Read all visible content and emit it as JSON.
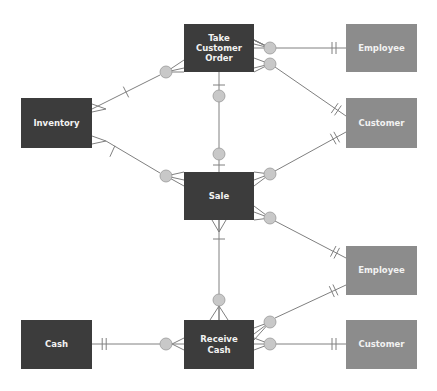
{
  "diagram": {
    "type": "REA entity-relationship diagram",
    "colors": {
      "event_box": "#3c3c3c",
      "agent_box": "#8c8c8c",
      "line": "#808080",
      "optional_circle": "#c8c8c8",
      "text": "#f2f2f2"
    },
    "entities": [
      {
        "id": "take_order",
        "label": "Take\nCustomer Order",
        "style": "dark",
        "x": 184,
        "y": 24,
        "w": 70,
        "h": 48
      },
      {
        "id": "employee_top",
        "label": "Employee",
        "style": "light",
        "x": 346,
        "y": 24,
        "w": 71,
        "h": 48
      },
      {
        "id": "inventory",
        "label": "Inventory",
        "style": "dark",
        "x": 21,
        "y": 98,
        "w": 71,
        "h": 50
      },
      {
        "id": "customer_top",
        "label": "Customer",
        "style": "light",
        "x": 346,
        "y": 98,
        "w": 71,
        "h": 50
      },
      {
        "id": "sale",
        "label": "Sale",
        "style": "dark",
        "x": 184,
        "y": 172,
        "w": 70,
        "h": 48
      },
      {
        "id": "employee_mid",
        "label": "Employee",
        "style": "light",
        "x": 346,
        "y": 246,
        "w": 71,
        "h": 49
      },
      {
        "id": "cash",
        "label": "Cash",
        "style": "dark",
        "x": 21,
        "y": 320,
        "w": 71,
        "h": 49
      },
      {
        "id": "receive_cash",
        "label": "Receive\nCash",
        "style": "dark",
        "x": 184,
        "y": 320,
        "w": 70,
        "h": 49
      },
      {
        "id": "customer_bottom",
        "label": "Customer",
        "style": "light",
        "x": 346,
        "y": 320,
        "w": 71,
        "h": 49
      }
    ],
    "relationships": [
      {
        "from": "take_order",
        "to": "employee_top",
        "from_end": "zero-or-many",
        "to_end": "one-and-only-one"
      },
      {
        "from": "take_order",
        "to": "customer_top",
        "from_end": "zero-or-many",
        "to_end": "one-and-only-one"
      },
      {
        "from": "take_order",
        "to": "inventory",
        "from_end": "zero-or-many",
        "to_end": "one-or-many"
      },
      {
        "from": "take_order",
        "to": "sale",
        "from_end": "zero-or-one",
        "to_end": "zero-or-one"
      },
      {
        "from": "sale",
        "to": "inventory",
        "from_end": "zero-or-many",
        "to_end": "one-or-many"
      },
      {
        "from": "sale",
        "to": "customer_top",
        "from_end": "zero-or-many",
        "to_end": "one-and-only-one"
      },
      {
        "from": "sale",
        "to": "employee_mid",
        "from_end": "zero-or-many",
        "to_end": "one-and-only-one"
      },
      {
        "from": "sale",
        "to": "receive_cash",
        "from_end": "one-or-many",
        "to_end": "zero-or-many"
      },
      {
        "from": "receive_cash",
        "to": "employee_mid",
        "from_end": "zero-or-many",
        "to_end": "one-and-only-one"
      },
      {
        "from": "receive_cash",
        "to": "customer_bottom",
        "from_end": "zero-or-many",
        "to_end": "one-and-only-one"
      },
      {
        "from": "receive_cash",
        "to": "cash",
        "from_end": "zero-or-many",
        "to_end": "one-and-only-one"
      }
    ]
  }
}
